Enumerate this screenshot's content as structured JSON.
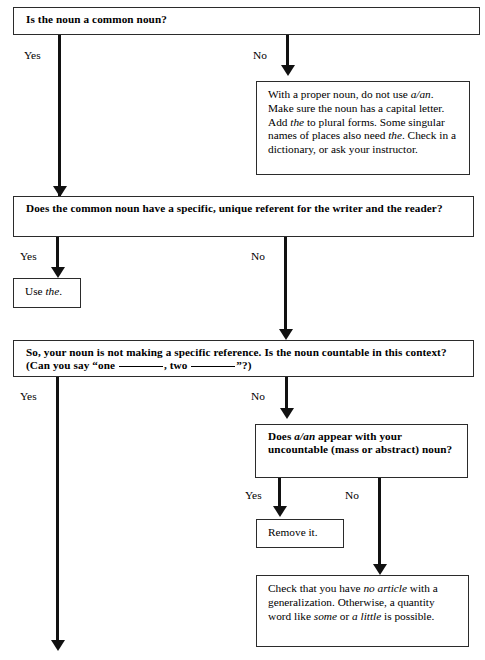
{
  "diagram": {
    "nodes": {
      "q1": {
        "id": "q1",
        "kind": "question",
        "text": "Is the noun a common noun?"
      },
      "n1": {
        "id": "n1",
        "kind": "note",
        "text_runs": [
          {
            "t": "With a proper noun, do not use ",
            "i": false
          },
          {
            "t": "a/an",
            "i": true
          },
          {
            "t": ". Make sure the noun has a capital letter. Add ",
            "i": false
          },
          {
            "t": "the",
            "i": true
          },
          {
            "t": " to plural forms. Some singular names of places also need ",
            "i": false
          },
          {
            "t": "the",
            "i": true
          },
          {
            "t": ". Check in a dictionary, or ask your instructor.",
            "i": false
          }
        ],
        "text": "With a proper noun, do not use a/an. Make sure the noun has a capital letter. Add the to plural forms. Some singular names of places also need the. Check in a dictionary, or ask your instructor."
      },
      "q2": {
        "id": "q2",
        "kind": "question",
        "text": "Does the common noun have a specific, unique referent for the writer and the reader?"
      },
      "a1": {
        "id": "a1",
        "kind": "action",
        "text_runs": [
          {
            "t": "Use ",
            "i": false
          },
          {
            "t": "the",
            "i": true
          },
          {
            "t": ".",
            "i": false
          }
        ],
        "text": "Use the."
      },
      "q3": {
        "id": "q3",
        "kind": "question",
        "text_runs": [
          {
            "t": "So, your noun is not making a specific reference. Is the noun countable in this context? (Can you say “one ",
            "i": false
          },
          {
            "t": "__BLANK__",
            "i": false
          },
          {
            "t": ", two ",
            "i": false
          },
          {
            "t": "__BLANK__",
            "i": false
          },
          {
            "t": "”?)",
            "i": false
          }
        ],
        "text": "So, your noun is not making a specific reference. Is the noun countable in this context? (Can you say “one ______, two ______”?)"
      },
      "q4": {
        "id": "q4",
        "kind": "question",
        "text_runs": [
          {
            "t": "Does ",
            "i": false
          },
          {
            "t": "a/an",
            "i": true
          },
          {
            "t": " appear with your uncountable (mass or abstract) noun?",
            "i": false
          }
        ],
        "text": "Does a/an appear with your uncountable (mass or abstract) noun?"
      },
      "a2": {
        "id": "a2",
        "kind": "action",
        "text": "Remove it."
      },
      "n2": {
        "id": "n2",
        "kind": "note",
        "text_runs": [
          {
            "t": "Check that you have ",
            "i": false
          },
          {
            "t": "no article",
            "i": true
          },
          {
            "t": " with a generalization. Otherwise, a quantity word like ",
            "i": false
          },
          {
            "t": "some",
            "i": true
          },
          {
            "t": " or ",
            "i": false
          },
          {
            "t": "a little",
            "i": true
          },
          {
            "t": " is possible.",
            "i": false
          }
        ],
        "text": "Check that you have no article with a generalization. Otherwise, a quantity word like some or a little is possible."
      }
    },
    "edges": [
      {
        "id": "e1",
        "from": "q1",
        "to": "continue-left",
        "label": "Yes"
      },
      {
        "id": "e2",
        "from": "q1",
        "to": "n1",
        "label": "No"
      },
      {
        "id": "e3",
        "from": "q2",
        "to": "a1",
        "label": "Yes"
      },
      {
        "id": "e4",
        "from": "q2",
        "to": "q3",
        "label": "No"
      },
      {
        "id": "e5",
        "from": "q3",
        "to": "continue-bottom",
        "label": "Yes"
      },
      {
        "id": "e6",
        "from": "q3",
        "to": "q4",
        "label": "No"
      },
      {
        "id": "e7",
        "from": "q4",
        "to": "a2",
        "label": "Yes"
      },
      {
        "id": "e8",
        "from": "q4",
        "to": "n2",
        "label": "No"
      }
    ],
    "colors": {
      "border": "#2b2b2b",
      "connector": "#111111",
      "background": "#ffffff",
      "text": "#000000"
    }
  }
}
